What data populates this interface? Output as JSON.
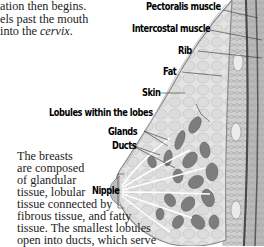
{
  "intro_text": {
    "lines": [
      {
        "text": "ation then begins."
      },
      {
        "text": "els past the mouth"
      },
      {
        "prefix": "into the ",
        "emphasis": "cervix",
        "suffix": "."
      }
    ]
  },
  "caption_text": {
    "lines": [
      "The breasts",
      "are composed",
      "of glandular",
      "tissue, lobular",
      "tissue connected by",
      "fibrous tissue, and fatty",
      "tissue. The smallest lobules",
      "open into ducts, which serve"
    ]
  },
  "diagram": {
    "labels": {
      "pectoralis": "Pectoralis muscle",
      "intercostal": "Intercostal muscle",
      "rib": "Rib",
      "fat": "Fat",
      "skin": "Skin",
      "lobules": "Lobules within the lobes",
      "glands": "Glands",
      "ducts": "Ducts",
      "nipple": "Nipple"
    },
    "colors": {
      "skin_outline": "#8a8a8a",
      "fat_tissue": "#d9d9d9",
      "lobule_fill": "#7a7a7a",
      "chest_wall": "#b0b0b0",
      "muscle_dark": "#555555",
      "leader_line": "#333333"
    }
  }
}
